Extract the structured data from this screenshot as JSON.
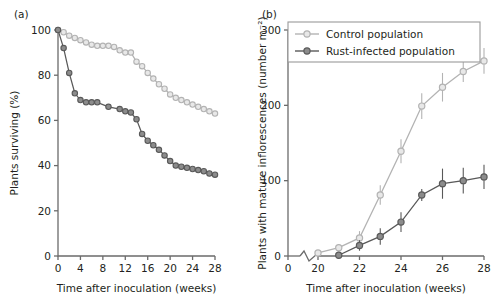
{
  "figure": {
    "panel_a_label": "(a)",
    "panel_b_label": "(b)"
  },
  "colors": {
    "control": "#b3b3b3",
    "control_fill": "#e8e8e8",
    "rust": "#595959",
    "rust_fill": "#8c8c8c",
    "axis": "#6b6b6b",
    "text": "#231f20",
    "legend_border": "#9a9a9a"
  },
  "legend": {
    "position": "top-left-inside-panel-b",
    "entries": [
      {
        "label": "Control population",
        "marker": "open-circle",
        "color": "#b3b3b3"
      },
      {
        "label": "Rust-infected population",
        "marker": "filled-circle",
        "color": "#595959"
      }
    ]
  },
  "chart_data": [
    {
      "id": "panel-a",
      "type": "line",
      "title": "(a)",
      "xlabel": "Time after inoculation (weeks)",
      "ylabel": "Plants surviving (%)",
      "xlim": [
        0,
        28
      ],
      "ylim": [
        0,
        100
      ],
      "xticks": [
        0,
        4,
        8,
        12,
        16,
        20,
        24,
        28
      ],
      "yticks": [
        0,
        20,
        40,
        60,
        80,
        100
      ],
      "grid": false,
      "legend": "none",
      "series": [
        {
          "name": "Control population",
          "marker": "open-circle",
          "color": "#b3b3b3",
          "x": [
            0,
            1,
            2,
            3,
            4,
            5,
            6,
            7,
            8,
            9,
            10,
            11,
            12,
            13,
            14,
            15,
            16,
            17,
            18,
            19,
            20,
            21,
            22,
            23,
            24,
            25,
            26,
            27,
            28
          ],
          "y": [
            100,
            99,
            97.5,
            96.5,
            95.5,
            94.5,
            93.5,
            93,
            93,
            93,
            92.5,
            91,
            90,
            90,
            86,
            84,
            81,
            78.5,
            76,
            74,
            71.5,
            70,
            69,
            68,
            67,
            66,
            65,
            64,
            63
          ]
        },
        {
          "name": "Rust-infected population",
          "marker": "filled-circle",
          "color": "#595959",
          "x": [
            0,
            1,
            2,
            3,
            4,
            5,
            6,
            7,
            9,
            11,
            12,
            13,
            14,
            15,
            16,
            17,
            18,
            19,
            20,
            21,
            22,
            23,
            24,
            25,
            26,
            27,
            28
          ],
          "y": [
            100,
            92,
            81,
            72,
            69,
            68,
            68,
            68,
            66,
            65,
            64,
            63.5,
            60.5,
            54,
            51,
            49,
            47,
            44.5,
            42,
            40,
            39.5,
            39,
            38.5,
            38,
            37.5,
            36.5,
            36
          ]
        }
      ]
    },
    {
      "id": "panel-b",
      "type": "line",
      "title": "(b)",
      "xlabel": "Time after inoculation (weeks)",
      "ylabel": "Plants with mature inflorescences (number m⁻²)",
      "xlim": [
        0,
        28
      ],
      "ylim": [
        0,
        300
      ],
      "xticks": [
        0,
        20,
        22,
        24,
        26,
        28
      ],
      "yticks": [
        0,
        100,
        200,
        300
      ],
      "axis_break": {
        "axis": "x",
        "between": [
          0,
          20
        ],
        "style": "zigzag"
      },
      "grid": false,
      "legend": "upper left",
      "series": [
        {
          "name": "Control population",
          "marker": "open-circle",
          "color": "#b3b3b3",
          "x": [
            20,
            21,
            22,
            23,
            24,
            25,
            26,
            27,
            28
          ],
          "y": [
            4,
            11,
            24,
            81,
            139,
            199,
            224,
            245,
            259
          ],
          "yerr": [
            3,
            5,
            9,
            13,
            16,
            17,
            19,
            14,
            17
          ]
        },
        {
          "name": "Rust-infected population",
          "marker": "filled-circle",
          "color": "#595959",
          "x": [
            21,
            22,
            23,
            24,
            25,
            26,
            27,
            28
          ],
          "y": [
            1,
            14,
            26,
            45,
            81,
            96,
            100,
            105
          ],
          "yerr": [
            2,
            7,
            11,
            13,
            8,
            20,
            17,
            16
          ]
        }
      ]
    }
  ]
}
